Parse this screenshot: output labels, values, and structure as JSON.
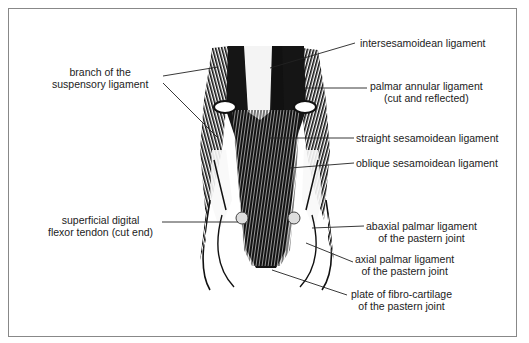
{
  "diagram": {
    "labels": {
      "branch_suspensory": {
        "line1": "branch of the",
        "line2": "suspensory ligament"
      },
      "intersesamoidean": {
        "line1": "intersesamoidean ligament"
      },
      "palmar_annular": {
        "line1": "palmar annular ligament",
        "line2": "(cut and reflected)"
      },
      "straight_sesamoidean": {
        "line1": "straight sesamoidean ligament"
      },
      "oblique_sesamoidean": {
        "line1": "oblique sesamoidean ligament"
      },
      "superficial_flexor": {
        "line1": "superficial digital",
        "line2": "flexor tendon (cut end)"
      },
      "abaxial_palmar": {
        "line1": "abaxial palmar ligament",
        "line2": "of the pastern joint"
      },
      "axial_palmar": {
        "line1": "axial palmar ligament",
        "line2": "of the pastern joint"
      },
      "fibro_cartilage": {
        "line1": "plate of fibro-cartilage",
        "line2": "of the pastern joint"
      }
    },
    "colors": {
      "ink": "#111111",
      "frame": "#888888",
      "background": "#ffffff"
    }
  }
}
